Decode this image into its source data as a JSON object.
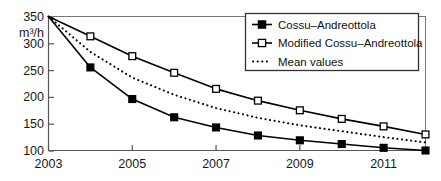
{
  "chart_data": {
    "type": "line",
    "title": "",
    "xlabel": "",
    "ylabel": "m3/h",
    "ylabel_display": "m³/h",
    "x": [
      2003,
      2004,
      2005,
      2006,
      2007,
      2008,
      2009,
      2010,
      2011,
      2012
    ],
    "xlim": [
      2003,
      2012
    ],
    "ylim": [
      100,
      350
    ],
    "yticks": [
      100,
      150,
      200,
      250,
      300,
      350
    ],
    "ytick_labels": [
      "100",
      "150",
      "200",
      "250",
      "300",
      "350"
    ],
    "xticks": [
      2003,
      2005,
      2007,
      2009,
      2011
    ],
    "xtick_labels": [
      "2003",
      "2005",
      "2007",
      "2009",
      "2011"
    ],
    "grid": false,
    "legend_position": "top-right",
    "series": [
      {
        "name": "Cossu–Andreottola",
        "marker": "filled-square",
        "linestyle": "solid",
        "color": "#000000",
        "values": [
          350,
          255,
          196,
          162,
          143,
          128,
          119,
          112,
          105,
          100
        ]
      },
      {
        "name": "Modified Cossu–Andreottola",
        "marker": "open-square",
        "linestyle": "solid",
        "color": "#000000",
        "values": [
          350,
          313,
          276,
          245,
          215,
          193,
          175,
          159,
          145,
          130
        ]
      },
      {
        "name": "Mean values",
        "marker": "none",
        "linestyle": "dotted",
        "color": "#000000",
        "values": [
          350,
          284,
          236,
          204,
          179,
          161,
          147,
          136,
          125,
          115
        ]
      }
    ]
  },
  "legend": {
    "items": [
      {
        "label": "Cossu–Andreottola",
        "marker": "filled-square"
      },
      {
        "label": "Modified Cossu–Andreottola",
        "marker": "open-square"
      },
      {
        "label": "Mean values",
        "marker": "dotted-line"
      }
    ]
  },
  "axes": {
    "y_unit": "m³/h"
  }
}
